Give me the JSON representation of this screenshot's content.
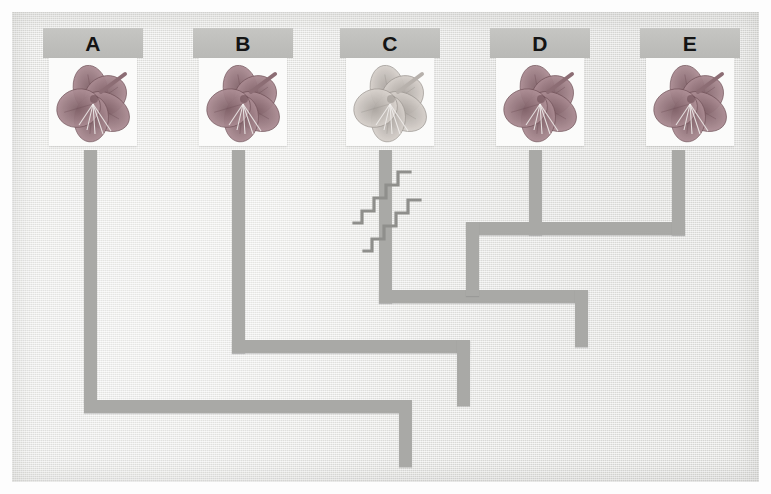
{
  "figure": {
    "type": "cladogram",
    "background_color": "#e9e9e6",
    "branch_color": "#a9a9a6",
    "label_band_color": "#bebebb",
    "photo_background": "#fbfbfa"
  },
  "taxa": [
    {
      "id": "A",
      "label": "A",
      "band_x": 43,
      "band_y": 28,
      "stem_x": 84,
      "flower_color": "#9e7f86",
      "flower_tone": "dark",
      "image_name": "azalea-flower-photo-a"
    },
    {
      "id": "B",
      "label": "B",
      "band_x": 193,
      "band_y": 28,
      "stem_x": 232,
      "flower_color": "#9e7f86",
      "flower_tone": "dark",
      "image_name": "azalea-flower-photo-b"
    },
    {
      "id": "C",
      "label": "C",
      "band_x": 340,
      "band_y": 28,
      "stem_x": 379,
      "flower_color": "#c9c3be",
      "flower_tone": "light",
      "image_name": "azalea-flower-photo-c"
    },
    {
      "id": "D",
      "label": "D",
      "band_x": 490,
      "band_y": 28,
      "stem_x": 529,
      "flower_color": "#9e7f86",
      "flower_tone": "dark",
      "image_name": "azalea-flower-photo-d"
    },
    {
      "id": "E",
      "label": "E",
      "band_x": 640,
      "band_y": 28,
      "stem_x": 672,
      "flower_color": "#9e7f86",
      "flower_tone": "dark",
      "image_name": "azalea-flower-photo-e"
    }
  ],
  "topology": {
    "newick": "(A,(B,(C,(D,E))))",
    "nodes": [
      {
        "name": "node-DE",
        "children": [
          "D",
          "E"
        ],
        "y": 290
      },
      {
        "name": "node-CDE",
        "children": [
          "C",
          "node-DE"
        ],
        "y": 340
      },
      {
        "name": "node-BCDE",
        "children": [
          "B",
          "node-CDE"
        ],
        "y": 400
      },
      {
        "name": "root",
        "children": [
          "A",
          "node-BCDE"
        ],
        "y": 412
      }
    ]
  },
  "hash_marks": [
    {
      "name": "derived-character-mark-1",
      "x": 355,
      "y": 175,
      "steps": 4,
      "note": "zigzag tick on branch"
    },
    {
      "name": "derived-character-mark-2",
      "x": 365,
      "y": 205,
      "steps": 4,
      "note": "zigzag tick on branch"
    }
  ]
}
